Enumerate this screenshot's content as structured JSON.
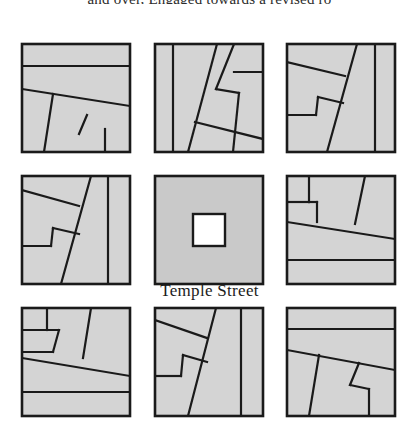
{
  "figure": {
    "top_caption": "and over, Engaged towards a revised ro",
    "street_label": "Temple Street",
    "fill_color": "#d4d4d4",
    "center_fill_color": "#c9c9c9",
    "line_color": "#1a1a1a",
    "courtyard_color": "#ffffff",
    "background_color": "#ffffff"
  },
  "grid": {
    "rows": 3,
    "columns": 3,
    "cell_width": 108,
    "cell_height": 108,
    "origin_x": 22,
    "origin_y": 44,
    "gap_x": 24,
    "gap_y": 24
  },
  "blocks": [
    {
      "id": "block-1",
      "name": "block-top-left",
      "row": 0,
      "col": 0,
      "x": 22,
      "y": 44,
      "w": 108,
      "h": 108,
      "lines": [
        [
          0,
          22,
          108,
          22
        ],
        [
          0,
          45,
          108,
          62
        ],
        [
          31,
          50,
          22,
          108
        ],
        [
          65,
          71,
          57,
          90
        ],
        [
          83,
          85,
          83,
          108
        ]
      ]
    },
    {
      "id": "block-2",
      "name": "block-top-center",
      "row": 0,
      "col": 1,
      "x": 155,
      "y": 44,
      "w": 108,
      "h": 108,
      "lines": [
        [
          18,
          0,
          18,
          108
        ],
        [
          62,
          0,
          33,
          108
        ],
        [
          79,
          0,
          61,
          45
        ],
        [
          61,
          45,
          84,
          49
        ],
        [
          84,
          49,
          78,
          108
        ],
        [
          79,
          28,
          108,
          28
        ],
        [
          40,
          78,
          108,
          95
        ]
      ]
    },
    {
      "id": "block-3",
      "name": "block-top-right",
      "row": 0,
      "col": 2,
      "x": 287,
      "y": 44,
      "w": 108,
      "h": 108,
      "lines": [
        [
          0,
          18,
          58,
          32
        ],
        [
          70,
          0,
          40,
          108
        ],
        [
          88,
          0,
          88,
          108
        ],
        [
          0,
          71,
          29,
          71
        ],
        [
          29,
          71,
          31,
          53
        ],
        [
          31,
          53,
          56,
          59
        ]
      ]
    },
    {
      "id": "block-4",
      "name": "block-middle-left",
      "row": 1,
      "col": 0,
      "x": 22,
      "y": 176,
      "w": 108,
      "h": 108,
      "lines": [
        [
          0,
          14,
          57,
          30
        ],
        [
          69,
          0,
          39,
          108
        ],
        [
          86,
          0,
          86,
          108
        ],
        [
          0,
          70,
          29,
          70
        ],
        [
          29,
          70,
          31,
          52
        ],
        [
          31,
          52,
          57,
          58
        ]
      ]
    },
    {
      "id": "block-5",
      "name": "block-center-courtyard",
      "row": 1,
      "col": 1,
      "x": 155,
      "y": 176,
      "w": 108,
      "h": 108,
      "courtyard": {
        "x": 38,
        "y": 38,
        "w": 32,
        "h": 32
      },
      "lines": []
    },
    {
      "id": "block-6",
      "name": "block-middle-right",
      "row": 1,
      "col": 2,
      "x": 287,
      "y": 176,
      "w": 108,
      "h": 108,
      "lines": [
        [
          22,
          0,
          22,
          26
        ],
        [
          22,
          26,
          0,
          26
        ],
        [
          0,
          26,
          0,
          46
        ],
        [
          22,
          26,
          30,
          26
        ],
        [
          30,
          26,
          30,
          46
        ],
        [
          0,
          46,
          108,
          63
        ],
        [
          78,
          0,
          68,
          48
        ],
        [
          0,
          84,
          108,
          84
        ]
      ]
    },
    {
      "id": "block-7",
      "name": "block-bottom-left",
      "row": 2,
      "col": 0,
      "x": 22,
      "y": 308,
      "w": 108,
      "h": 108,
      "lines": [
        [
          25,
          0,
          25,
          22
        ],
        [
          0,
          22,
          37,
          22
        ],
        [
          37,
          22,
          31,
          44
        ],
        [
          31,
          44,
          0,
          44
        ],
        [
          0,
          50,
          108,
          68
        ],
        [
          69,
          0,
          61,
          50
        ],
        [
          0,
          84,
          108,
          84
        ]
      ]
    },
    {
      "id": "block-8",
      "name": "block-bottom-center",
      "row": 2,
      "col": 1,
      "x": 155,
      "y": 308,
      "w": 108,
      "h": 108,
      "lines": [
        [
          0,
          12,
          52,
          30
        ],
        [
          61,
          0,
          33,
          108
        ],
        [
          86,
          0,
          86,
          108
        ],
        [
          0,
          68,
          26,
          68
        ],
        [
          26,
          68,
          28,
          47
        ],
        [
          28,
          47,
          52,
          54
        ]
      ]
    },
    {
      "id": "block-9",
      "name": "block-bottom-right",
      "row": 2,
      "col": 2,
      "x": 287,
      "y": 308,
      "w": 108,
      "h": 108,
      "lines": [
        [
          0,
          21,
          108,
          21
        ],
        [
          0,
          42,
          108,
          62
        ],
        [
          32,
          47,
          22,
          108
        ],
        [
          72,
          55,
          63,
          77
        ],
        [
          63,
          77,
          82,
          81
        ],
        [
          82,
          81,
          82,
          108
        ]
      ]
    }
  ],
  "labels": {
    "street": {
      "text": "Temple Street",
      "x": 209,
      "y": 292
    }
  }
}
